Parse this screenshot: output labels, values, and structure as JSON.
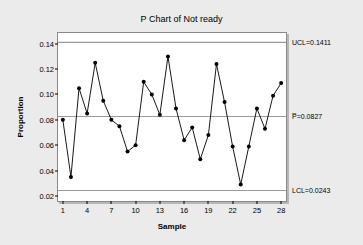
{
  "chart_data": {
    "type": "line",
    "title": "P Chart of Not ready",
    "xlabel": "Sample",
    "ylabel": "Proportion",
    "x": [
      1,
      2,
      3,
      4,
      5,
      6,
      7,
      8,
      9,
      10,
      11,
      12,
      13,
      14,
      15,
      16,
      17,
      18,
      19,
      20,
      21,
      22,
      23,
      24,
      25,
      26,
      27,
      28
    ],
    "values": [
      0.08,
      0.035,
      0.105,
      0.085,
      0.125,
      0.095,
      0.08,
      0.075,
      0.055,
      0.06,
      0.11,
      0.1,
      0.084,
      0.13,
      0.089,
      0.064,
      0.074,
      0.049,
      0.068,
      0.124,
      0.094,
      0.059,
      0.029,
      0.059,
      0.089,
      0.073,
      0.099,
      0.109
    ],
    "series": [
      {
        "name": "Proportion",
        "values": [
          0.08,
          0.035,
          0.105,
          0.085,
          0.125,
          0.095,
          0.08,
          0.075,
          0.055,
          0.06,
          0.11,
          0.1,
          0.084,
          0.13,
          0.089,
          0.064,
          0.074,
          0.049,
          0.068,
          0.124,
          0.094,
          0.059,
          0.029,
          0.059,
          0.089,
          0.073,
          0.099,
          0.109
        ]
      }
    ],
    "xlim": [
      0.4,
      28.6
    ],
    "ylim": [
      0.016,
      0.1485
    ],
    "xticks": [
      1,
      4,
      7,
      10,
      13,
      16,
      19,
      22,
      25,
      28
    ],
    "xticklabels": [
      "1",
      "4",
      "7",
      "10",
      "13",
      "16",
      "19",
      "22",
      "25",
      "28"
    ],
    "yticks": [
      0.02,
      0.04,
      0.06,
      0.08,
      0.1,
      0.12,
      0.14
    ],
    "yticklabels": [
      "0.02",
      "0.04",
      "0.06",
      "0.08",
      "0.10",
      "0.12",
      "0.14"
    ],
    "grid": false,
    "legend": "none",
    "control_limits": [
      {
        "key": "ucl",
        "name": "UCL",
        "value": 0.1411,
        "label": "UCL=0.1411"
      },
      {
        "key": "center",
        "name": "P-bar",
        "value": 0.0827,
        "label": "P̅=0.0827"
      },
      {
        "key": "lcl",
        "name": "LCL",
        "value": 0.0243,
        "label": "LCL=0.0243"
      }
    ],
    "colors": {
      "background": "#ebebeb",
      "plot_background": "#ffffff",
      "series_line": "#000000",
      "marker": "#000000",
      "limit_line": "#9a9a9a",
      "frame": "#8a8a8a"
    }
  }
}
